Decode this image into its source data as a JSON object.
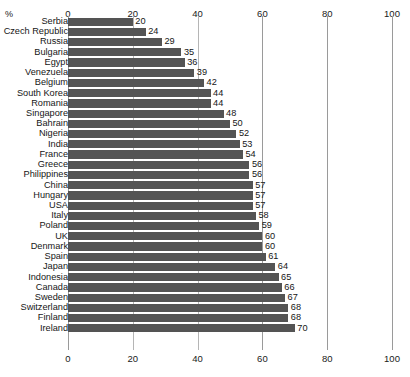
{
  "title_partial": "",
  "axis": {
    "unit_label": "%",
    "ticks": [
      0,
      20,
      40,
      60,
      80,
      100
    ],
    "tick_labels": [
      "0",
      "20",
      "40",
      "60",
      "80",
      "100"
    ]
  },
  "colors": {
    "bar": "#545454",
    "gridline": "#9a9a9a",
    "text": "#161616",
    "background": "#ffffff"
  },
  "chart_data": {
    "type": "bar",
    "orientation": "horizontal",
    "title": "",
    "xlabel": "%",
    "ylabel": "",
    "xlim": [
      0,
      100
    ],
    "grid": true,
    "legend": false,
    "categories": [
      "Serbia",
      "Czech Republic",
      "Russia",
      "Bulgaria",
      "Egypt",
      "Venezuela",
      "Belgium",
      "South Korea",
      "Romania",
      "Singapore",
      "Bahrain",
      "Nigeria",
      "India",
      "France",
      "Greece",
      "Philippines",
      "China",
      "Hungary",
      "USA",
      "Italy",
      "Poland",
      "UK",
      "Denmark",
      "Spain",
      "Japan",
      "Indonesia",
      "Canada",
      "Sweden",
      "Switzerland",
      "Finland",
      "Ireland"
    ],
    "values": [
      20,
      24,
      29,
      35,
      36,
      39,
      42,
      44,
      44,
      48,
      50,
      52,
      53,
      54,
      56,
      56,
      57,
      57,
      57,
      58,
      59,
      60,
      60,
      61,
      64,
      65,
      66,
      67,
      68,
      68,
      70
    ],
    "value_labels": [
      "20",
      "24",
      "29",
      "35",
      "36",
      "39",
      "42",
      "44",
      "44",
      "48",
      "50",
      "52",
      "53",
      "54",
      "56",
      "56",
      "57",
      "57",
      "57",
      "58",
      "59",
      "60",
      "60",
      "61",
      "64",
      "65",
      "66",
      "67",
      "68",
      "68",
      "70"
    ]
  }
}
